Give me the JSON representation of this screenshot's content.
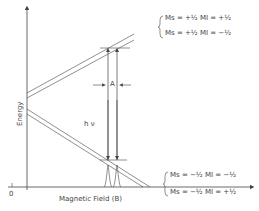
{
  "diagram": {
    "y_axis_label": "Energy",
    "x_axis_label": "Magnetic Field (B)",
    "origin_label": "0",
    "transition_label": "h ν",
    "splitting_label": "A",
    "upper_levels": [
      {
        "label": "Ms = +½ MI = +½"
      },
      {
        "label": "Ms = +½ MI = −½"
      }
    ],
    "lower_levels": [
      {
        "label": "Ms = −½ MI = −½"
      },
      {
        "label": "Ms = −½ MI = +½"
      }
    ],
    "colors": {
      "line": "#444444",
      "background": "#ffffff"
    }
  }
}
